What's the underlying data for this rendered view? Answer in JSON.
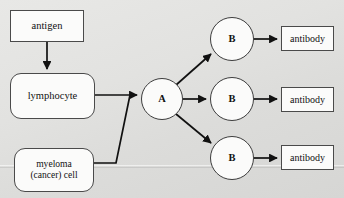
{
  "diagram": {
    "background_color": "#e3e3e1",
    "line_color": "#111111",
    "node_fill": "#fbfbfa",
    "node_border": "#4a4a4a",
    "nodes": [
      {
        "id": "antigen",
        "label": "antigen",
        "shape": "rect",
        "x": 10,
        "y": 10,
        "w": 74,
        "h": 32
      },
      {
        "id": "lymphocyte",
        "label": "lymphocyte",
        "shape": "rounded",
        "x": 10,
        "y": 73,
        "w": 85,
        "h": 46
      },
      {
        "id": "myeloma",
        "label_line1": "myeloma",
        "label_line2": "(cancer) cell",
        "shape": "rounded",
        "x": 14,
        "y": 148,
        "w": 80,
        "h": 44
      },
      {
        "id": "cell-a",
        "label": "A",
        "shape": "circle",
        "cx": 162,
        "cy": 99,
        "r": 21
      },
      {
        "id": "cell-b-top",
        "label": "B",
        "shape": "circle",
        "cx": 232,
        "cy": 39,
        "r": 22
      },
      {
        "id": "cell-b-mid",
        "label": "B",
        "shape": "circle",
        "cx": 232,
        "cy": 99,
        "r": 22
      },
      {
        "id": "cell-b-bot",
        "label": "B",
        "shape": "circle",
        "cx": 232,
        "cy": 158,
        "r": 22
      },
      {
        "id": "antibody-top",
        "label": "antibody",
        "shape": "rect",
        "x": 281,
        "y": 26,
        "w": 53,
        "h": 25
      },
      {
        "id": "antibody-mid",
        "label": "antibody",
        "shape": "rect",
        "x": 281,
        "y": 87,
        "w": 53,
        "h": 25
      },
      {
        "id": "antibody-bot",
        "label": "antibody",
        "shape": "rect",
        "x": 281,
        "y": 145,
        "w": 53,
        "h": 25
      }
    ],
    "edges": [
      {
        "id": "antigen-to-lymphocyte",
        "from": "antigen",
        "to": "lymphocyte",
        "style": "straight-arrow"
      },
      {
        "id": "lymphocyte-to-a",
        "from": "lymphocyte",
        "to": "cell-a",
        "style": "straight-arrow"
      },
      {
        "id": "myeloma-to-a",
        "from": "myeloma",
        "to": "cell-a",
        "style": "elbow-diagonal"
      },
      {
        "id": "a-to-b-top",
        "from": "cell-a",
        "to": "cell-b-top",
        "style": "diagonal-arrow"
      },
      {
        "id": "a-to-b-mid",
        "from": "cell-a",
        "to": "cell-b-mid",
        "style": "straight-arrow"
      },
      {
        "id": "a-to-b-bot",
        "from": "cell-a",
        "to": "cell-b-bot",
        "style": "diagonal-arrow"
      },
      {
        "id": "b-top-to-antibody",
        "from": "cell-b-top",
        "to": "antibody-top",
        "style": "straight-arrow"
      },
      {
        "id": "b-mid-to-antibody",
        "from": "cell-b-mid",
        "to": "antibody-mid",
        "style": "straight-arrow"
      },
      {
        "id": "b-bot-to-antibody",
        "from": "cell-b-bot",
        "to": "antibody-bot",
        "style": "straight-arrow"
      }
    ]
  }
}
